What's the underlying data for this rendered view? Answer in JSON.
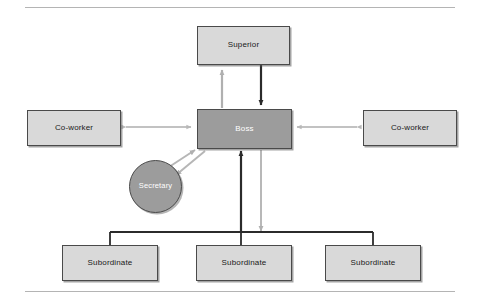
{
  "diagram": {
    "nodes": {
      "superior": {
        "label": "Superior",
        "shape": "rect",
        "fill": "#d9d9d9",
        "text_color": "#1a1a1a"
      },
      "boss": {
        "label": "Boss",
        "shape": "rect",
        "fill": "#9c9c9c",
        "text_color": "#ffffff"
      },
      "coworker_left": {
        "label": "Co-worker",
        "shape": "rect",
        "fill": "#d9d9d9",
        "text_color": "#1a1a1a"
      },
      "coworker_right": {
        "label": "Co-worker",
        "shape": "rect",
        "fill": "#d9d9d9",
        "text_color": "#1a1a1a"
      },
      "secretary": {
        "label": "Secretary",
        "shape": "circle",
        "fill": "#9c9c9c",
        "text_color": "#ffffff"
      },
      "subordinate_1": {
        "label": "Subordinate",
        "shape": "rect",
        "fill": "#d9d9d9",
        "text_color": "#1a1a1a"
      },
      "subordinate_2": {
        "label": "Subordinate",
        "shape": "rect",
        "fill": "#d9d9d9",
        "text_color": "#1a1a1a"
      },
      "subordinate_3": {
        "label": "Subordinate",
        "shape": "rect",
        "fill": "#d9d9d9",
        "text_color": "#1a1a1a"
      }
    },
    "edges": [
      {
        "id": "boss-to-superior",
        "from": "boss",
        "to": "superior",
        "style": "gray-arrow",
        "direction": "up"
      },
      {
        "id": "superior-to-boss",
        "from": "superior",
        "to": "boss",
        "style": "dark-arrow",
        "direction": "down"
      },
      {
        "id": "coworker-left-boss",
        "from": "coworker_left",
        "to": "boss",
        "style": "gray-arrow",
        "direction": "both"
      },
      {
        "id": "coworker-right-boss",
        "from": "coworker_right",
        "to": "boss",
        "style": "gray-arrow",
        "direction": "both"
      },
      {
        "id": "secretary-to-boss",
        "from": "secretary",
        "to": "boss",
        "style": "gray-arrow",
        "direction": "up-right"
      },
      {
        "id": "boss-to-secretary",
        "from": "boss",
        "to": "secretary",
        "style": "gray-arrow",
        "direction": "down-left"
      },
      {
        "id": "subordinates-to-boss",
        "from": "subordinates",
        "to": "boss",
        "style": "dark-arrow",
        "direction": "up"
      },
      {
        "id": "boss-to-subordinates",
        "from": "boss",
        "to": "subordinates",
        "style": "gray-arrow",
        "direction": "down"
      },
      {
        "id": "subordinate-bus",
        "from": "bus",
        "to": "subordinates",
        "style": "dark-line",
        "direction": "none"
      }
    ],
    "colors": {
      "light_fill": "#d9d9d9",
      "dark_fill": "#9c9c9c",
      "node_border": "#4a4a4a",
      "dark_connector": "#2b2b2b",
      "gray_connector": "#b0b0b0",
      "rule": "#b4b4b4",
      "background": "#ffffff"
    },
    "rules": {
      "top_label": "top divider rule",
      "bottom_label": "bottom divider rule"
    }
  }
}
